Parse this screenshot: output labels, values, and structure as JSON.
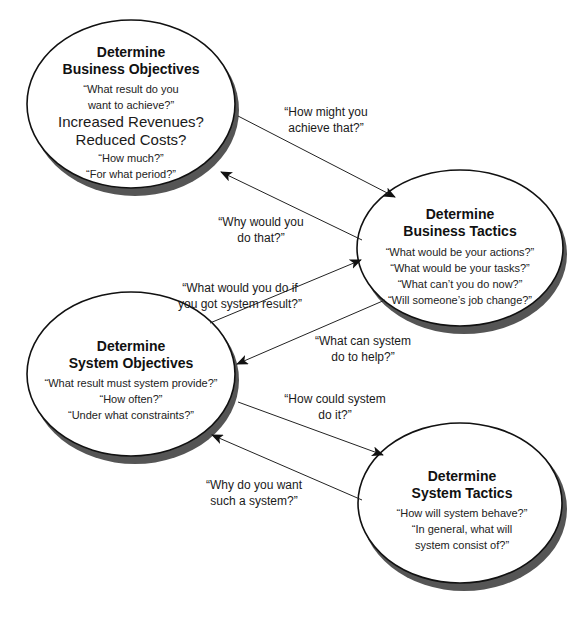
{
  "nodes": {
    "business_objectives": {
      "title_line1": "Determine",
      "title_line2": "Business Objectives",
      "q1": "“What result do you",
      "q2": "want to achieve?”",
      "big1": "Increased Revenues?",
      "big2": "Reduced Costs?",
      "q3": "“How much?”",
      "q4": "“For what period?”"
    },
    "business_tactics": {
      "title_line1": "Determine",
      "title_line2": "Business Tactics",
      "q1": "“What would be your actions?”",
      "q2": "“What would be your tasks?”",
      "q3": "“What can’t you do now?”",
      "q4": "“Will someone’s  job change?”"
    },
    "system_objectives": {
      "title_line1": "Determine",
      "title_line2": "System Objectives",
      "q1": "“What result must system provide?”",
      "q2": "“How often?”",
      "q3": "“Under what constraints?”"
    },
    "system_tactics": {
      "title_line1": "Determine",
      "title_line2": "System Tactics",
      "q1": "“How will system behave?”",
      "q2": "“In general, what will",
      "q3": "system consist of?”"
    }
  },
  "edges": {
    "bo_to_bt": {
      "line1": "“How might you",
      "line2": "achieve that?”"
    },
    "bt_to_bo": {
      "line1": "“Why would you",
      "line2": "do that?”"
    },
    "so_to_bt": {
      "line1": "“What would you do if",
      "line2": "you got system result?”"
    },
    "bt_to_so": {
      "line1": "“What can system",
      "line2": "do to  help?”"
    },
    "so_to_st": {
      "line1": "“How could system",
      "line2": "do it?”"
    },
    "st_to_so": {
      "line1": "“Why do you want",
      "line2": "such a system?”"
    }
  },
  "colors": {
    "outline": "#111111",
    "shadow": "#555555",
    "fill": "#ffffff"
  }
}
